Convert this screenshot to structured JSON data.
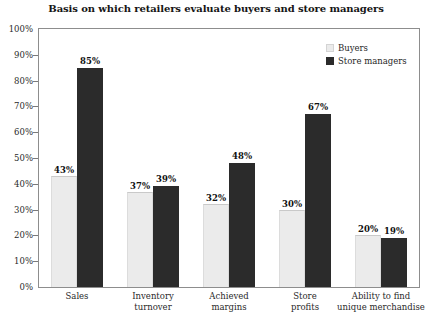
{
  "chart_data": {
    "type": "bar",
    "title": "Basis on which retailers evaluate buyers and store managers",
    "xlabel": "",
    "ylabel": "",
    "ylim": [
      0,
      100
    ],
    "ytick_labels": [
      "100%",
      "90%",
      "80%",
      "70%",
      "60%",
      "50%",
      "40%",
      "30%",
      "20%",
      "10%",
      "0%"
    ],
    "ytick_values": [
      100,
      90,
      80,
      70,
      60,
      50,
      40,
      30,
      20,
      10,
      0
    ],
    "grid": false,
    "legend_position": "top-right",
    "value_suffix": "%",
    "categories": [
      "Sales",
      "Inventory\nturnover",
      "Achieved\nmargins",
      "Store\nprofits",
      "Ability to find\nunique merchandise"
    ],
    "category_lines": [
      [
        "Sales"
      ],
      [
        "Inventory",
        "turnover"
      ],
      [
        "Achieved",
        "margins"
      ],
      [
        "Store",
        "profits"
      ],
      [
        "Ability to find",
        "unique merchandise"
      ]
    ],
    "series": [
      {
        "name": "Buyers",
        "color": "#ebebeb",
        "values": [
          43,
          37,
          32,
          30,
          20
        ],
        "labels": [
          "43%",
          "37%",
          "32%",
          "30%",
          "20%"
        ]
      },
      {
        "name": "Store managers",
        "color": "#2b2b2b",
        "values": [
          85,
          39,
          48,
          67,
          19
        ],
        "labels": [
          "85%",
          "39%",
          "48%",
          "67%",
          "19%"
        ]
      }
    ]
  }
}
